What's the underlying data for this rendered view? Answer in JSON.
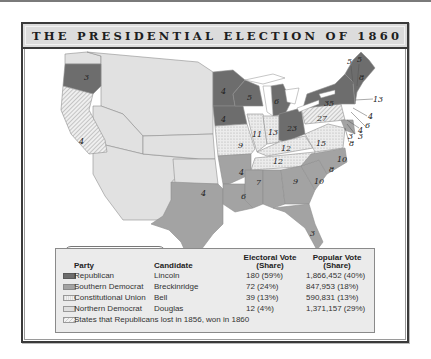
{
  "title": "THE PRESIDENTIAL ELECTION OF 1860",
  "map": {
    "non_voting_label": "Non-voting territory",
    "state_electoral_votes": [
      {
        "state": "Oregon",
        "votes": "3",
        "party": "Republican"
      },
      {
        "state": "California",
        "votes": "4",
        "party": "Republican (flipped)"
      },
      {
        "state": "Minnesota",
        "votes": "4",
        "party": "Republican"
      },
      {
        "state": "Wisconsin",
        "votes": "5",
        "party": "Republican"
      },
      {
        "state": "Iowa",
        "votes": "4",
        "party": "Republican"
      },
      {
        "state": "Michigan",
        "votes": "6",
        "party": "Republican"
      },
      {
        "state": "Illinois",
        "votes": "11",
        "party": "Republican (flipped)"
      },
      {
        "state": "Indiana",
        "votes": "13",
        "party": "Republican (flipped)"
      },
      {
        "state": "Ohio",
        "votes": "23",
        "party": "Republican"
      },
      {
        "state": "Pennsylvania",
        "votes": "27",
        "party": "Republican (flipped)"
      },
      {
        "state": "New York",
        "votes": "35",
        "party": "Republican"
      },
      {
        "state": "Vermont",
        "votes": "5",
        "party": "Republican"
      },
      {
        "state": "New Hampshire",
        "votes": "5",
        "party": "Republican"
      },
      {
        "state": "Maine",
        "votes": "8",
        "party": "Republican"
      },
      {
        "state": "Massachusetts",
        "votes": "13",
        "party": "Republican"
      },
      {
        "state": "Rhode Island",
        "votes": "4",
        "party": "Republican"
      },
      {
        "state": "Connecticut",
        "votes": "6",
        "party": "Republican"
      },
      {
        "state": "New Jersey",
        "votes": "4 / 3",
        "party": "Split"
      },
      {
        "state": "Delaware",
        "votes": "3",
        "party": "Southern Democrat"
      },
      {
        "state": "Maryland",
        "votes": "8",
        "party": "Southern Democrat"
      },
      {
        "state": "Missouri",
        "votes": "9",
        "party": "Northern Democrat"
      },
      {
        "state": "Kentucky",
        "votes": "12",
        "party": "Constitutional Union"
      },
      {
        "state": "Tennessee",
        "votes": "12",
        "party": "Constitutional Union"
      },
      {
        "state": "Virginia",
        "votes": "15",
        "party": "Constitutional Union"
      },
      {
        "state": "North Carolina",
        "votes": "10",
        "party": "Southern Democrat"
      },
      {
        "state": "South Carolina",
        "votes": "8",
        "party": "Southern Democrat"
      },
      {
        "state": "Georgia",
        "votes": "10",
        "party": "Southern Democrat"
      },
      {
        "state": "Alabama",
        "votes": "9",
        "party": "Southern Democrat"
      },
      {
        "state": "Mississippi",
        "votes": "7",
        "party": "Southern Democrat"
      },
      {
        "state": "Louisiana",
        "votes": "6",
        "party": "Southern Democrat"
      },
      {
        "state": "Arkansas",
        "votes": "4",
        "party": "Southern Democrat"
      },
      {
        "state": "Texas",
        "votes": "4",
        "party": "Southern Democrat"
      },
      {
        "state": "Florida",
        "votes": "3",
        "party": "Southern Democrat"
      }
    ]
  },
  "legend": {
    "headers": {
      "party": "Party",
      "candidate": "Candidate",
      "electoral": "Electoral Vote (Share)",
      "electoral_l1": "Electoral Vote",
      "electoral_l2": "(Share)",
      "popular": "Popular Vote (Share)",
      "popular_l1": "Popular Vote",
      "popular_l2": "(Share)"
    },
    "rows": [
      {
        "party": "Republican",
        "candidate": "Lincoln",
        "electoral": "180 (59%)",
        "popular": "1,866,452 (40%)",
        "color": "#6d6d6d"
      },
      {
        "party": "Southern Democrat",
        "candidate": "Breckinridge",
        "electoral": "72 (24%)",
        "popular": "847,953 (18%)",
        "color": "#a3a3a3"
      },
      {
        "party": "Constitutional Union",
        "candidate": "Bell",
        "electoral": "39 (13%)",
        "popular": "590,831 (13%)",
        "color": "#e6e6e6"
      },
      {
        "party": "Northern Democrat",
        "candidate": "Douglas",
        "electoral": "12 (4%)",
        "popular": "1,371,157 (29%)",
        "color": "#dedede"
      }
    ],
    "note": "States that Republicans lost in 1856, won in 1860"
  },
  "colors": {
    "republican": "#6d6d6d",
    "southern_democrat": "#a3a3a3",
    "constitutional_union": "#e6e6e6",
    "northern_democrat": "#dedede",
    "non_voting": "#e1e1e1",
    "frame": "#3a3a3a",
    "title_bg": "#dcdcdc"
  }
}
